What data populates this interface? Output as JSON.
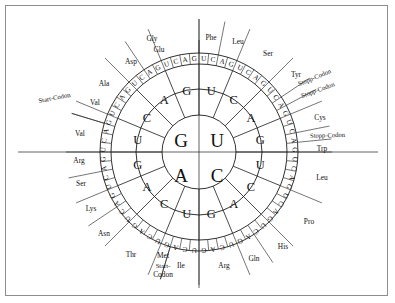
{
  "figure": {
    "type": "codon-wheel",
    "center": {
      "x": 199,
      "y": 152
    },
    "radii": {
      "inner": 37,
      "ring2": 63,
      "ring3": 88,
      "ring4": 99
    }
  },
  "bases": {
    "first": [
      "G",
      "U",
      "A",
      "C"
    ],
    "first_quadrant_positions": [
      "top-left",
      "top-right",
      "bottom-left",
      "bottom-right"
    ]
  },
  "ring1": [
    {
      "label": "U",
      "start_deg": 0,
      "end_deg": 90
    },
    {
      "label": "C",
      "start_deg": 90,
      "end_deg": 180
    },
    {
      "label": "A",
      "start_deg": 180,
      "end_deg": 270
    },
    {
      "label": "G",
      "start_deg": 270,
      "end_deg": 360
    }
  ],
  "ring2": [
    "U",
    "C",
    "A",
    "G",
    "U",
    "C",
    "A",
    "G",
    "U",
    "C",
    "A",
    "G",
    "U",
    "C",
    "A",
    "G"
  ],
  "ring2_labels_clockwise_from_top": [
    "U",
    "C",
    "A",
    "G",
    "U",
    "C",
    "A",
    "G",
    "U",
    "C",
    "A",
    "G",
    "U",
    "C",
    "A",
    "G"
  ],
  "ring3": [
    "U",
    "C",
    "A",
    "G",
    "U",
    "C",
    "A",
    "G",
    "U",
    "C",
    "A",
    "G",
    "U",
    "C",
    "A",
    "G",
    "U",
    "C",
    "A",
    "G",
    "U",
    "C",
    "A",
    "G",
    "U",
    "C",
    "A",
    "G",
    "U",
    "C",
    "A",
    "G",
    "U",
    "C",
    "A",
    "G",
    "U",
    "C",
    "A",
    "G",
    "U",
    "C",
    "A",
    "G",
    "U",
    "C",
    "A",
    "G",
    "U",
    "C",
    "A",
    "G",
    "U",
    "C",
    "A",
    "G",
    "U",
    "C",
    "A",
    "G",
    "U",
    "C",
    "A",
    "G"
  ],
  "amino_acids": [
    {
      "name": "Phe",
      "codons": 2,
      "start_index": 0
    },
    {
      "name": "Leu",
      "codons": 2,
      "start_index": 2
    },
    {
      "name": "Ser",
      "codons": 4,
      "start_index": 4
    },
    {
      "name": "Tyr",
      "codons": 2,
      "start_index": 8
    },
    {
      "name": "Stopp-Codon",
      "codons": 1,
      "start_index": 10
    },
    {
      "name": "Stopp-Codon",
      "codons": 1,
      "start_index": 11
    },
    {
      "name": "Cys",
      "codons": 2,
      "start_index": 12
    },
    {
      "name": "Stopp-Codon",
      "codons": 1,
      "start_index": 14
    },
    {
      "name": "Trp",
      "codons": 1,
      "start_index": 15
    },
    {
      "name": "Leu",
      "codons": 4,
      "start_index": 16
    },
    {
      "name": "Pro",
      "codons": 4,
      "start_index": 20
    },
    {
      "name": "His",
      "codons": 2,
      "start_index": 24
    },
    {
      "name": "Gln",
      "codons": 2,
      "start_index": 26
    },
    {
      "name": "Arg",
      "codons": 4,
      "start_index": 28
    },
    {
      "name": "Ile",
      "codons": 3,
      "start_index": 32
    },
    {
      "name": "Met",
      "codons": 1,
      "start_index": 35
    },
    {
      "name": "Start-Codon",
      "codons": 1,
      "start_index": 35
    },
    {
      "name": "Thr",
      "codons": 4,
      "start_index": 36
    },
    {
      "name": "Asn",
      "codons": 2,
      "start_index": 40
    },
    {
      "name": "Lys",
      "codons": 2,
      "start_index": 42
    },
    {
      "name": "Ser",
      "codons": 2,
      "start_index": 44
    },
    {
      "name": "Arg",
      "codons": 2,
      "start_index": 46
    },
    {
      "name": "Val",
      "codons": 3,
      "start_index": 48
    },
    {
      "name": "Val",
      "codons": 1,
      "start_index": 51
    },
    {
      "name": "Start-Codon",
      "codons": 1,
      "start_index": 51
    },
    {
      "name": "Ala",
      "codons": 4,
      "start_index": 52
    },
    {
      "name": "Asp",
      "codons": 2,
      "start_index": 56
    },
    {
      "name": "Glu",
      "codons": 2,
      "start_index": 58
    },
    {
      "name": "Gly",
      "codons": 4,
      "start_index": 60
    }
  ],
  "outer_labels": [
    {
      "id": "gly",
      "text": "Gly",
      "x": 152,
      "y": 41,
      "rot": 0,
      "anchor": "middle"
    },
    {
      "id": "phe",
      "text": "Phe",
      "x": 211,
      "y": 40,
      "rot": 0,
      "anchor": "middle"
    },
    {
      "id": "leu1",
      "text": "Leu",
      "x": 238,
      "y": 44,
      "rot": 0,
      "anchor": "middle"
    },
    {
      "id": "ser1",
      "text": "Ser",
      "x": 268,
      "y": 56,
      "rot": 0,
      "anchor": "middle"
    },
    {
      "id": "tyr",
      "text": "Tyr",
      "x": 296,
      "y": 77,
      "rot": 0,
      "anchor": "middle"
    },
    {
      "id": "stop1",
      "text": "Stopp-Codon",
      "x": 299,
      "y": 86,
      "rot": -22,
      "anchor": "start"
    },
    {
      "id": "stop2",
      "text": "Stopp-Codon",
      "x": 302,
      "y": 98,
      "rot": -20,
      "anchor": "start"
    },
    {
      "id": "cys",
      "text": "Cys",
      "x": 320,
      "y": 120,
      "rot": 0,
      "anchor": "middle"
    },
    {
      "id": "stop3",
      "text": "Stopp-Codon",
      "x": 310,
      "y": 138,
      "rot": -2,
      "anchor": "start"
    },
    {
      "id": "trp",
      "text": "Trp",
      "x": 322,
      "y": 151,
      "rot": 0,
      "anchor": "middle"
    },
    {
      "id": "leu2",
      "text": "Leu",
      "x": 322,
      "y": 180,
      "rot": 0,
      "anchor": "middle"
    },
    {
      "id": "pro",
      "text": "Pro",
      "x": 309,
      "y": 224,
      "rot": 0,
      "anchor": "middle"
    },
    {
      "id": "his",
      "text": "His",
      "x": 283,
      "y": 249,
      "rot": 0,
      "anchor": "middle"
    },
    {
      "id": "gln",
      "text": "Gln",
      "x": 254,
      "y": 261,
      "rot": 0,
      "anchor": "middle"
    },
    {
      "id": "arg1",
      "text": "Arg",
      "x": 224,
      "y": 268,
      "rot": 0,
      "anchor": "middle"
    },
    {
      "id": "ile",
      "text": "Ile",
      "x": 181,
      "y": 268,
      "rot": 0,
      "anchor": "middle"
    },
    {
      "id": "met",
      "text": "Met",
      "x": 163,
      "y": 258,
      "rot": 0,
      "anchor": "middle"
    },
    {
      "id": "mstart",
      "text": "Start-",
      "x": 163,
      "y": 268,
      "rot": 0,
      "anchor": "middle"
    },
    {
      "id": "mstart2",
      "text": "Codon",
      "x": 163,
      "y": 277,
      "rot": 0,
      "anchor": "middle"
    },
    {
      "id": "thr",
      "text": "Thr",
      "x": 131,
      "y": 257,
      "rot": 0,
      "anchor": "middle"
    },
    {
      "id": "asn",
      "text": "Asn",
      "x": 104,
      "y": 236,
      "rot": 0,
      "anchor": "middle"
    },
    {
      "id": "lys",
      "text": "Lys",
      "x": 91,
      "y": 211,
      "rot": 0,
      "anchor": "middle"
    },
    {
      "id": "ser2",
      "text": "Ser",
      "x": 81,
      "y": 186,
      "rot": 0,
      "anchor": "middle"
    },
    {
      "id": "arg2",
      "text": "Arg",
      "x": 79,
      "y": 163,
      "rot": 0,
      "anchor": "middle"
    },
    {
      "id": "val1",
      "text": "Val",
      "x": 80,
      "y": 136,
      "rot": 0,
      "anchor": "middle"
    },
    {
      "id": "vstart",
      "text": "Start-Codon",
      "x": 39,
      "y": 103,
      "rot": -11,
      "anchor": "start"
    },
    {
      "id": "val2",
      "text": "Val",
      "x": 95,
      "y": 105,
      "rot": 0,
      "anchor": "middle"
    },
    {
      "id": "ala",
      "text": "Ala",
      "x": 104,
      "y": 86,
      "rot": 0,
      "anchor": "middle"
    },
    {
      "id": "asp",
      "text": "Asp",
      "x": 131,
      "y": 64,
      "rot": 0,
      "anchor": "middle"
    },
    {
      "id": "glu",
      "text": "Glu",
      "x": 159,
      "y": 52,
      "rot": 0,
      "anchor": "middle"
    }
  ],
  "colors": {
    "ink": "#111111",
    "line": "#1a1a1a",
    "border": "#8d8d8d",
    "background": "#ffffff"
  }
}
